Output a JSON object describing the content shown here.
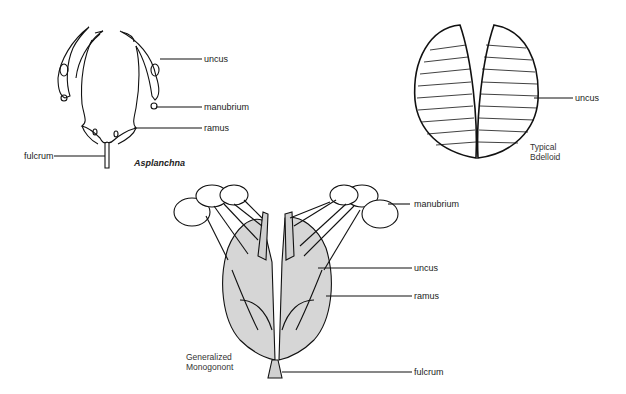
{
  "diagrams": [
    {
      "name": "Asplanchna",
      "caption": "Asplanchna",
      "labels": {
        "uncus": "uncus",
        "manubrium": "manubrium",
        "ramus": "ramus",
        "fulcrum": "fulcrum"
      }
    },
    {
      "name": "Typical Bdelloid",
      "caption_line1": "Typical",
      "caption_line2": "Bdelloid",
      "labels": {
        "uncus": "uncus"
      }
    },
    {
      "name": "Generalized Monogonont",
      "caption_line1": "Generalized",
      "caption_line2": "Monogonont",
      "labels": {
        "manubrium": "manubrium",
        "uncus": "uncus",
        "ramus": "ramus",
        "fulcrum": "fulcrum"
      }
    }
  ]
}
